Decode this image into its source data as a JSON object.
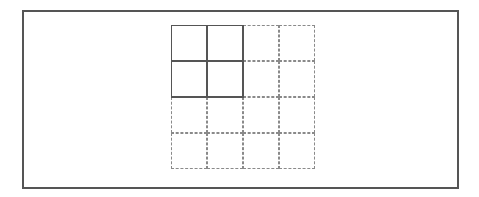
{
  "table_picker": {
    "rows": 4,
    "cols": 4,
    "selected_rows": 2,
    "selected_cols": 2,
    "cell_size": 36,
    "colors": {
      "frame": "#555555",
      "selected_border": "#555555",
      "unselected_border": "#8a8a8a",
      "background": "#ffffff"
    }
  }
}
